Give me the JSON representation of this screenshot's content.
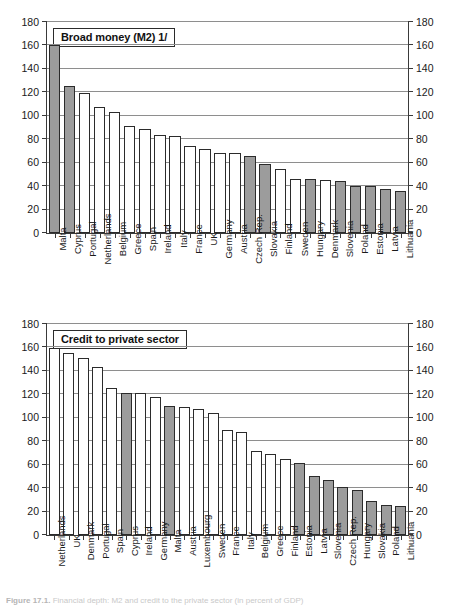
{
  "figure": {
    "caption_label": "Figure 17.1.",
    "caption_text": "Financial depth: M2 and credit to the private sector (in percent of GDP)"
  },
  "axis": {
    "ticks": [
      0,
      20,
      40,
      60,
      80,
      100,
      120,
      140,
      160,
      180
    ],
    "min": 0,
    "max": 180
  },
  "chart_data": [
    {
      "type": "bar",
      "title": "Broad money (M2) 1/",
      "xlabel": "",
      "ylabel": "",
      "ylim": [
        0,
        180
      ],
      "grid": true,
      "legend": "none",
      "categories": [
        "Malta",
        "Cyprus",
        "Portugal",
        "Netherlands",
        "Belgium",
        "Greece",
        "Spain",
        "Ireland",
        "Italy",
        "France",
        "UK",
        "Germany",
        "Austria",
        "Czech Rep.",
        "Slovakia",
        "Finland",
        "Sweden",
        "Hungary",
        "Denmark",
        "Slovenia",
        "Poland",
        "Estonia",
        "Latvia",
        "Lithuania"
      ],
      "values": [
        160,
        125,
        119.5,
        107.5,
        103.5,
        91,
        89,
        83.5,
        82.5,
        74.5,
        72,
        68.5,
        68,
        66,
        59,
        54.5,
        46.5,
        46,
        45,
        44,
        40.5,
        40,
        37.5,
        35.5
      ],
      "highlighted": [
        "Malta",
        "Cyprus",
        "Czech Rep.",
        "Slovakia",
        "Hungary",
        "Slovenia",
        "Poland",
        "Estonia",
        "Latvia",
        "Lithuania"
      ]
    },
    {
      "type": "bar",
      "title": "Credit to private sector",
      "xlabel": "",
      "ylabel": "",
      "ylim": [
        0,
        180
      ],
      "grid": true,
      "legend": "none",
      "categories": [
        "Netherlands",
        "UK",
        "Denmark",
        "Portugal",
        "Spain",
        "Cyprus",
        "Ireland",
        "Germany",
        "Malta",
        "Austria",
        "Luxembourg",
        "Sweden",
        "France",
        "Italy",
        "Belgium",
        "Greece",
        "Finland",
        "Estonia",
        "Latvia",
        "Slovenia",
        "Czech Rep.",
        "Hungary",
        "Slovakia",
        "Poland",
        "Lithuania"
      ],
      "values": [
        159.5,
        155.5,
        151,
        143.5,
        125,
        121.5,
        121,
        118,
        110,
        109,
        107.5,
        104.5,
        90,
        87.5,
        71.5,
        69.5,
        65,
        61.5,
        50,
        47,
        41,
        38.5,
        29,
        26,
        24.5
      ],
      "highlighted": [
        "Cyprus",
        "Malta",
        "Estonia",
        "Latvia",
        "Slovenia",
        "Czech Rep.",
        "Hungary",
        "Slovakia",
        "Poland",
        "Lithuania"
      ]
    }
  ],
  "colors": {
    "bar_fill": "#ffffff",
    "bar_fill_highlight": "#9c9c9c",
    "bar_stroke": "#2b2b2b",
    "gridline": "#8e8e8e",
    "axis": "#3a3a3a"
  }
}
